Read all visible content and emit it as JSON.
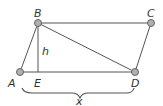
{
  "diagram": {
    "type": "parallelogram",
    "points": {
      "A": {
        "label": "A",
        "x": 20,
        "y": 72
      },
      "B": {
        "label": "B",
        "x": 38,
        "y": 23
      },
      "C": {
        "label": "C",
        "x": 151,
        "y": 23
      },
      "D": {
        "label": "D",
        "x": 135,
        "y": 72
      },
      "E": {
        "label": "E",
        "x": 38,
        "y": 72
      }
    },
    "segments": [
      "AB",
      "BC",
      "CD",
      "DA",
      "BD",
      "BE"
    ],
    "height_label": "h",
    "base_label": "x",
    "colors": {
      "line": "#555555",
      "vertex_fill": "#b0b0b0",
      "vertex_stroke": "#666666",
      "text": "#333333"
    }
  }
}
